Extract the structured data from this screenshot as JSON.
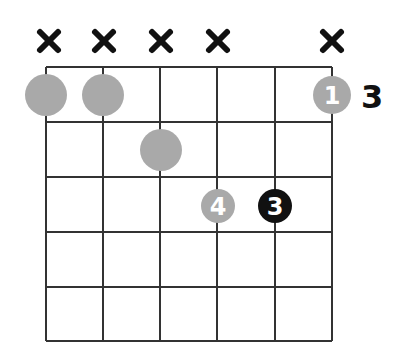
{
  "chord": {
    "strings": 6,
    "frets_shown": 5,
    "start_fret_label": "3",
    "muted_strings": [
      1,
      2,
      3,
      4,
      6
    ],
    "muted_symbol": "×",
    "notes": [
      {
        "string": 1,
        "fret": 1,
        "finger": "",
        "style": "gray"
      },
      {
        "string": 2,
        "fret": 1,
        "finger": "",
        "style": "gray"
      },
      {
        "string": 6,
        "fret": 1,
        "finger": "1",
        "style": "gray"
      },
      {
        "string": 3,
        "fret": 2,
        "finger": "",
        "style": "gray"
      },
      {
        "string": 4,
        "fret": 3,
        "finger": "4",
        "style": "gray"
      },
      {
        "string": 5,
        "fret": 3,
        "finger": "3",
        "style": "black"
      }
    ]
  },
  "colors": {
    "gray_dot": "#a9a9a9",
    "black_dot": "#111111",
    "grid": "#333333"
  }
}
